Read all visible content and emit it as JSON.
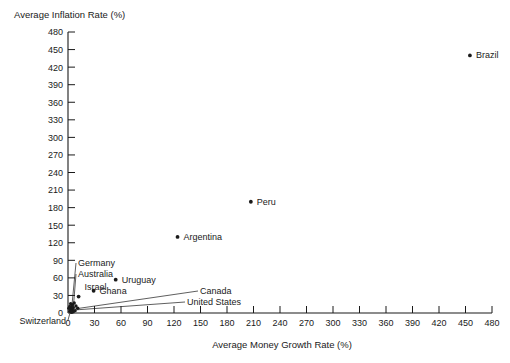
{
  "chart_data": {
    "type": "scatter",
    "title": "",
    "ylabel": "Average Inflation Rate (%)",
    "xlabel": "Average Money Growth Rate (%)",
    "xlim": [
      0,
      480
    ],
    "ylim": [
      0,
      480
    ],
    "xticks": [
      0,
      30,
      60,
      90,
      120,
      150,
      180,
      210,
      240,
      270,
      300,
      330,
      360,
      390,
      420,
      450,
      480
    ],
    "yticks": [
      0,
      30,
      60,
      90,
      120,
      150,
      180,
      210,
      240,
      270,
      300,
      330,
      360,
      390,
      420,
      450,
      480
    ],
    "grid": false,
    "legend": "none",
    "points": [
      {
        "label": "Brazil",
        "x": 455,
        "y": 440,
        "label_dx": 6,
        "label_dy": 3,
        "leader": false
      },
      {
        "label": "Peru",
        "x": 207,
        "y": 190,
        "label_dx": 6,
        "label_dy": 3,
        "leader": false
      },
      {
        "label": "Argentina",
        "x": 124,
        "y": 130,
        "label_dx": 6,
        "label_dy": 3,
        "leader": false
      },
      {
        "label": "Uruguay",
        "x": 54,
        "y": 57,
        "label_dx": 6,
        "label_dy": 3,
        "leader": false
      },
      {
        "label": "Ghana",
        "x": 29,
        "y": 38,
        "label_dx": 6,
        "label_dy": 3,
        "leader": false
      },
      {
        "label": "Israel",
        "x": 12,
        "y": 28,
        "label_dx": 6,
        "label_dy": -7,
        "leader": false
      },
      {
        "label": "Germany",
        "x": 4,
        "y": 6,
        "label_dx": 0,
        "label_dy": 0,
        "leader": true
      },
      {
        "label": "Australia",
        "x": 6,
        "y": 9,
        "label_dx": 0,
        "label_dy": 0,
        "leader": true
      },
      {
        "label": "Canada",
        "x": 8,
        "y": 7,
        "label_dx": 0,
        "label_dy": 0,
        "leader": true
      },
      {
        "label": "United States",
        "x": 6,
        "y": 5,
        "label_dx": 0,
        "label_dy": 0,
        "leader": true
      },
      {
        "label": "Switzerland",
        "x": 3,
        "y": 4,
        "label_dx": 0,
        "label_dy": 0,
        "leader": true
      }
    ],
    "cluster_dots": [
      {
        "x": 2,
        "y": 3
      },
      {
        "x": 3,
        "y": 7
      },
      {
        "x": 4,
        "y": 10
      },
      {
        "x": 5,
        "y": 5
      },
      {
        "x": 5,
        "y": 14
      },
      {
        "x": 6,
        "y": 9
      },
      {
        "x": 7,
        "y": 17
      },
      {
        "x": 8,
        "y": 4
      },
      {
        "x": 9,
        "y": 12
      },
      {
        "x": 3,
        "y": 16
      },
      {
        "x": 2,
        "y": 11
      },
      {
        "x": 6,
        "y": 2
      },
      {
        "x": 11,
        "y": 8
      },
      {
        "x": 1,
        "y": 8
      },
      {
        "x": 4,
        "y": 1
      }
    ]
  },
  "labels": {
    "y_axis_title": "Average Inflation Rate (%)",
    "x_axis_title": "Average Money Growth Rate (%)"
  }
}
